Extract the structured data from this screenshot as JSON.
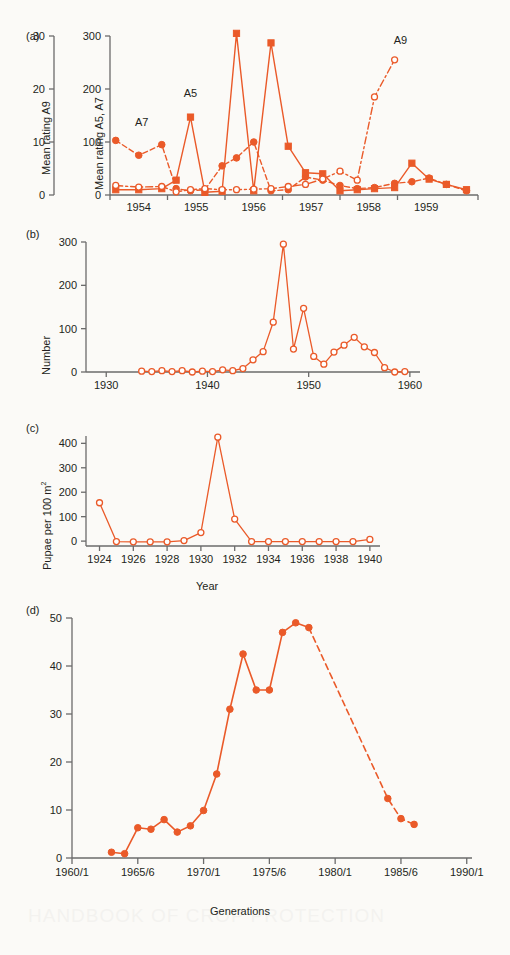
{
  "figure": {
    "background": "#fbfaf7",
    "accent": "#ea5a29",
    "axis_color": "#6b6b6b",
    "text_color": "#231f20"
  },
  "panels": [
    {
      "tag": "(a)",
      "left_axis_title": "Mean rating A9",
      "right_axis_title": "Mean rating A5, A7",
      "annotations": [
        "A7",
        "A5",
        "A9"
      ]
    },
    {
      "tag": "(b)",
      "axis_title": "Number"
    },
    {
      "tag": "(c)",
      "axis_title": "Pupae per 100 m",
      "axis_title_sup": "2",
      "xlabel": "Year"
    },
    {
      "tag": "(d)",
      "axis_title": "Eggs per leaf",
      "xlabel": "Generations"
    }
  ],
  "chart_data": [
    {
      "id": "panel-a",
      "type": "line",
      "title": "",
      "panel_label": "(a)",
      "ylabel": "Mean rating A9",
      "ylabel_secondary": "Mean rating A5, A7",
      "xlabel": "",
      "ylim": [
        0,
        30
      ],
      "yticks": [
        0,
        10,
        20,
        30
      ],
      "ylim_secondary": [
        0,
        300
      ],
      "yticks_secondary": [
        0,
        100,
        200,
        300
      ],
      "xlim": [
        1953.5,
        1959.9
      ],
      "xticks": [
        1954,
        1955,
        1956,
        1957,
        1958,
        1959
      ],
      "xtick_labels": [
        "1954",
        "1955",
        "1956",
        "1957",
        "1958",
        "1959"
      ],
      "grid": false,
      "legend": "none",
      "annotations": [
        {
          "text": "A7",
          "x": 1954.05,
          "y": 130
        },
        {
          "text": "A5",
          "x": 1954.9,
          "y": 185
        },
        {
          "text": "A9",
          "x": 1958.55,
          "y": 285
        }
      ],
      "series": [
        {
          "name": "A7",
          "marker": "filled-circle",
          "linestyle": "dashed",
          "axis": "secondary",
          "x": [
            1953.6,
            1954.0,
            1954.4,
            1954.65,
            1954.9,
            1955.15,
            1955.45,
            1955.7,
            1956.0,
            1956.3,
            1956.6,
            1956.9,
            1957.2,
            1957.5,
            1957.8,
            1958.1,
            1958.45,
            1958.75,
            1959.05,
            1959.35,
            1959.7
          ],
          "values": [
            103,
            75,
            95,
            12,
            8,
            10,
            55,
            70,
            100,
            8,
            10,
            34,
            28,
            18,
            12,
            14,
            22,
            25,
            32,
            20,
            8
          ]
        },
        {
          "name": "A5",
          "marker": "filled-square",
          "linestyle": "solid",
          "axis": "secondary",
          "x": [
            1953.6,
            1954.0,
            1954.4,
            1954.65,
            1954.9,
            1955.15,
            1955.45,
            1955.7,
            1956.0,
            1956.3,
            1956.6,
            1956.9,
            1957.2,
            1957.5,
            1957.8,
            1958.1,
            1958.45,
            1958.75,
            1959.05,
            1959.35,
            1959.7
          ],
          "values": [
            10,
            10,
            12,
            28,
            147,
            5,
            7,
            305,
            8,
            287,
            92,
            42,
            40,
            8,
            10,
            12,
            14,
            60,
            30,
            20,
            10
          ]
        },
        {
          "name": "A9",
          "marker": "open-circle",
          "linestyle": "dash-dot",
          "axis": "primary",
          "x": [
            1953.6,
            1954.0,
            1954.4,
            1954.65,
            1954.9,
            1955.15,
            1955.45,
            1955.7,
            1956.0,
            1956.3,
            1956.6,
            1956.9,
            1957.2,
            1957.5,
            1957.8,
            1958.1,
            1958.45
          ],
          "values": [
            1.8,
            1.5,
            1.6,
            0.6,
            1.0,
            1.2,
            1.0,
            1.0,
            1.1,
            1.2,
            1.6,
            2.0,
            3.0,
            4.5,
            2.8,
            18.5,
            25.5
          ]
        }
      ]
    },
    {
      "id": "panel-b",
      "type": "line",
      "panel_label": "(b)",
      "ylabel": "Number",
      "xlabel": "",
      "ylim": [
        0,
        300
      ],
      "yticks": [
        0,
        100,
        200,
        300
      ],
      "xlim": [
        1928,
        1961
      ],
      "xticks": [
        1930,
        1940,
        1950,
        1960
      ],
      "xtick_labels": [
        "1930",
        "1940",
        "1950",
        "1960"
      ],
      "grid": false,
      "marker": "open-circle",
      "linestyle": "solid",
      "x": [
        1933.5,
        1934.5,
        1935.5,
        1936.5,
        1937.5,
        1938.5,
        1939.5,
        1940.5,
        1941.5,
        1942.5,
        1943.5,
        1944.5,
        1945.5,
        1946.5,
        1947.5,
        1948.5,
        1949.5,
        1950.5,
        1951.5,
        1952.5,
        1953.5,
        1954.5,
        1955.5,
        1956.5,
        1957.5,
        1958.5,
        1959.5
      ],
      "values": [
        2,
        1,
        3,
        1,
        3,
        0,
        2,
        1,
        5,
        3,
        8,
        28,
        47,
        115,
        295,
        53,
        147,
        36,
        18,
        46,
        62,
        80,
        58,
        45,
        10,
        0,
        1
      ]
    },
    {
      "id": "panel-c",
      "type": "line",
      "panel_label": "(c)",
      "ylabel": "Pupae per 100 m²",
      "xlabel": "Year",
      "ylim": [
        -20,
        430
      ],
      "yticks": [
        0,
        100,
        200,
        300,
        400
      ],
      "xlim": [
        1923.2,
        1940.6
      ],
      "xticks": [
        1924,
        1926,
        1928,
        1930,
        1932,
        1934,
        1936,
        1938,
        1940
      ],
      "xtick_labels": [
        "1924",
        "1926",
        "1928",
        "1930",
        "1932",
        "1934",
        "1936",
        "1938",
        "1940"
      ],
      "grid": false,
      "marker": "open-circle",
      "linestyle": "solid",
      "x": [
        1924,
        1925,
        1926,
        1927,
        1928,
        1929,
        1930,
        1931,
        1932,
        1933,
        1934,
        1935,
        1936,
        1937,
        1938,
        1939,
        1940
      ],
      "values": [
        157,
        -2,
        -3,
        -3,
        -3,
        2,
        35,
        425,
        90,
        -2,
        -2,
        -2,
        -2,
        -2,
        -2,
        -2,
        7
      ]
    },
    {
      "id": "panel-d",
      "type": "line",
      "panel_label": "(d)",
      "ylabel": "Eggs per leaf",
      "xlabel": "Generations",
      "ylim": [
        0,
        50
      ],
      "yticks": [
        0,
        10,
        20,
        30,
        40,
        50
      ],
      "xlim": [
        1960,
        1990.4
      ],
      "xticks": [
        1960,
        1965,
        1970,
        1975,
        1980,
        1985,
        1990
      ],
      "xtick_labels": [
        "1960/1",
        "1965/6",
        "1970/1",
        "1975/6",
        "1980/1",
        "1985/6",
        "1990/1"
      ],
      "grid": false,
      "marker": "filled-circle",
      "segments": [
        {
          "linestyle": "solid",
          "x": [
            1963,
            1964,
            1965,
            1966,
            1967,
            1968,
            1969,
            1970,
            1971,
            1972,
            1973,
            1974,
            1975,
            1976,
            1977,
            1978
          ],
          "values": [
            1.2,
            0.9,
            6.3,
            6.0,
            8.0,
            5.4,
            6.7,
            9.9,
            17.5,
            31.0,
            42.5,
            35.0,
            35.0,
            47.0,
            49.0,
            48.0
          ]
        },
        {
          "linestyle": "dashed",
          "x": [
            1978,
            1984,
            1985,
            1986
          ],
          "values": [
            48.0,
            12.4,
            8.2,
            7.0
          ]
        }
      ],
      "x": [
        1963,
        1964,
        1965,
        1966,
        1967,
        1968,
        1969,
        1970,
        1971,
        1972,
        1973,
        1974,
        1975,
        1976,
        1977,
        1978,
        1984,
        1985,
        1986
      ],
      "values": [
        1.2,
        0.9,
        6.3,
        6.0,
        8.0,
        5.4,
        6.7,
        9.9,
        17.5,
        31.0,
        42.5,
        35.0,
        35.0,
        47.0,
        49.0,
        48.0,
        12.4,
        8.2,
        7.0
      ]
    }
  ]
}
